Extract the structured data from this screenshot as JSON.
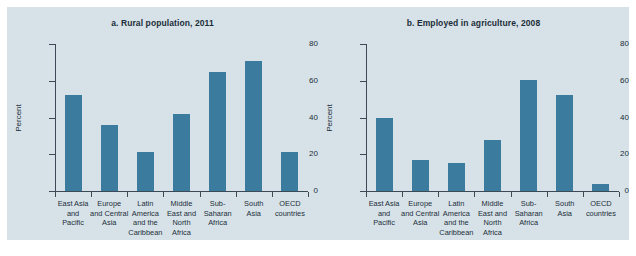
{
  "figure": {
    "background_color": "#d6e2e7",
    "bar_color": "#3b7b9e",
    "axis_color": "#3b4a55",
    "text_color": "#1c2d3a"
  },
  "chart_data": [
    {
      "type": "bar",
      "title": "a. Rural population, 2011",
      "xlabel": "",
      "ylabel": "Percent",
      "ylim": [
        0,
        80
      ],
      "yticks": [
        0,
        20,
        40,
        60,
        80
      ],
      "grid": false,
      "legend": null,
      "categories": [
        "East Asia and Pacific",
        "Europe and Central Asia",
        "Latin America and the Caribbean",
        "Middle East and North Africa",
        "Sub-Saharan Africa",
        "South Asia",
        "OECD countries"
      ],
      "category_lines": [
        [
          "East Asia",
          "and",
          "Pacific"
        ],
        [
          "Europe",
          "and Central",
          "Asia"
        ],
        [
          "Latin",
          "America",
          "and the",
          "Caribbean"
        ],
        [
          "Middle",
          "East and",
          "North",
          "Africa"
        ],
        [
          "Sub-",
          "Saharan",
          "Africa"
        ],
        [
          "South",
          "Asia"
        ],
        [
          "OECD",
          "countries"
        ]
      ],
      "values": [
        52.5,
        36,
        21,
        42,
        65,
        71,
        21
      ]
    },
    {
      "type": "bar",
      "title": "b. Employed in agriculture, 2008",
      "xlabel": "",
      "ylabel": "Percent",
      "ylim": [
        0,
        80
      ],
      "yticks": [
        0,
        20,
        40,
        60,
        80
      ],
      "grid": false,
      "legend": null,
      "categories": [
        "East Asia and Pacific",
        "Europe and Central Asia",
        "Latin America and the Caribbean",
        "Middle East and North Africa",
        "Sub-Saharan Africa",
        "South Asia",
        "OECD countries"
      ],
      "category_lines": [
        [
          "East Asia",
          "and",
          "Pacific"
        ],
        [
          "Europe",
          "and Central",
          "Asia"
        ],
        [
          "Latin",
          "America",
          "and the",
          "Caribbean"
        ],
        [
          "Middle",
          "East and",
          "North",
          "Africa"
        ],
        [
          "Sub-",
          "Saharan",
          "Africa"
        ],
        [
          "South",
          "Asia"
        ],
        [
          "OECD",
          "countries"
        ]
      ],
      "values": [
        39.5,
        17,
        15,
        28,
        60.5,
        52,
        4
      ]
    }
  ]
}
